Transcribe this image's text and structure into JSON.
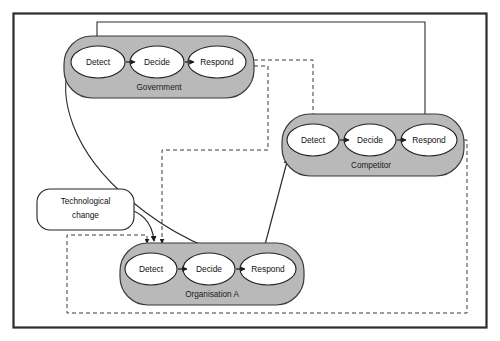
{
  "figure": {
    "type": "diagram",
    "frame_color": "#2b2b2b",
    "background": "#ffffff",
    "block_fill": "#b9b9b9",
    "block_stroke": "#3a3a3a",
    "node_fill": "#ffffff",
    "node_stroke": "#222222",
    "solid_link_color": "#222222",
    "dashed_link_color": "#3a3a3a"
  },
  "blocks": [
    {
      "id": "government",
      "label": "Government",
      "nodes": [
        {
          "id": "gov-detect",
          "label": "Detect"
        },
        {
          "id": "gov-decide",
          "label": "Decide"
        },
        {
          "id": "gov-respond",
          "label": "Respond"
        }
      ]
    },
    {
      "id": "competitor",
      "label": "Competitor",
      "nodes": [
        {
          "id": "cmp-detect",
          "label": "Detect"
        },
        {
          "id": "cmp-decide",
          "label": "Decide"
        },
        {
          "id": "cmp-respond",
          "label": "Respond"
        }
      ]
    },
    {
      "id": "organisation-a",
      "label": "Organisation A",
      "nodes": [
        {
          "id": "org-detect",
          "label": "Detect"
        },
        {
          "id": "org-decide",
          "label": "Decide"
        },
        {
          "id": "org-respond",
          "label": "Respond"
        }
      ]
    }
  ],
  "external": {
    "technological_change": {
      "id": "technological-change",
      "line1": "Technological",
      "line2": "change"
    }
  }
}
